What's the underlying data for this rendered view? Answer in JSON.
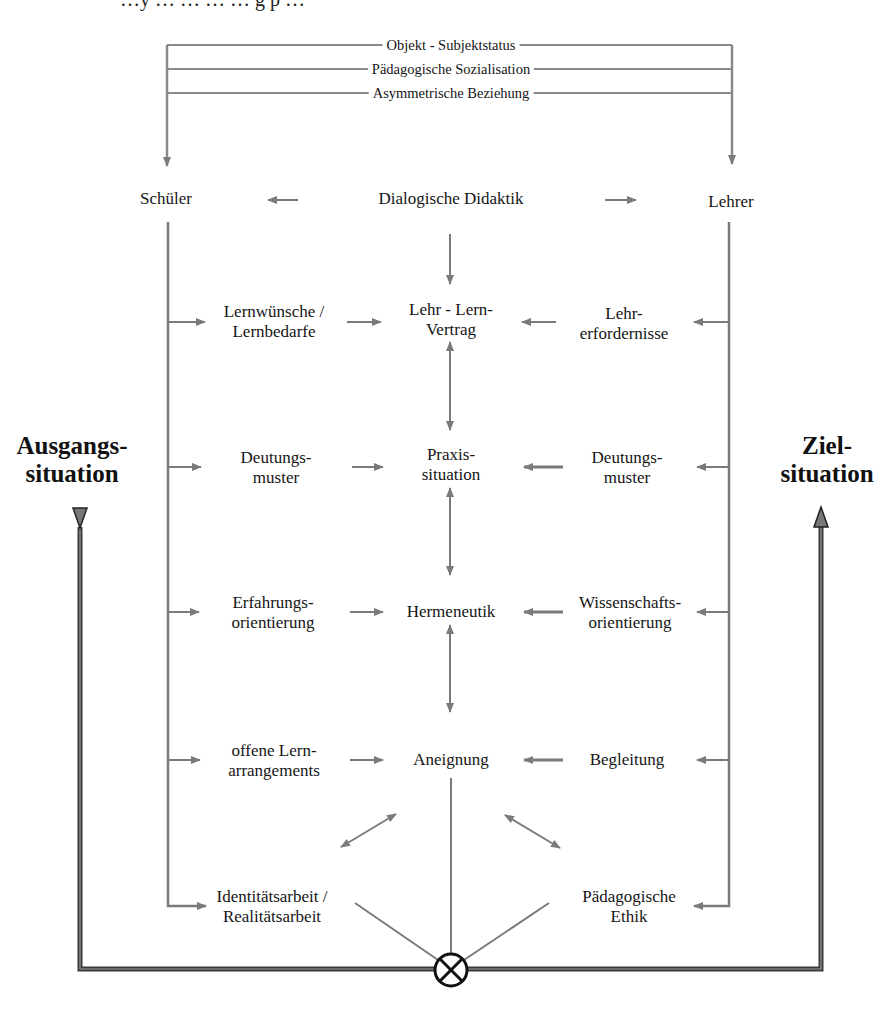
{
  "cutoff_text": "…y … … … … g p …",
  "top_relations": [
    {
      "label": "Objekt - Subjektstatus"
    },
    {
      "label": "Pädagogische Sozialisation"
    },
    {
      "label": "Asymmetrische Beziehung"
    }
  ],
  "actors": {
    "left": "Schüler",
    "center": "Dialogische Didaktik",
    "right": "Lehrer"
  },
  "sides": {
    "left": {
      "line1": "Ausgangs-",
      "line2": "situation"
    },
    "right": {
      "line1": "Ziel-",
      "line2": "situation"
    }
  },
  "rows": [
    {
      "left": {
        "line1": "Lernwünsche /",
        "line2": "Lernbedarfe"
      },
      "center": {
        "line1": "Lehr - Lern-",
        "line2": "Vertrag"
      },
      "right": {
        "line1": "Lehr-",
        "line2": "erfordernisse"
      }
    },
    {
      "left": {
        "line1": "Deutungs-",
        "line2": "muster"
      },
      "center": {
        "line1": "Praxis-",
        "line2": "situation"
      },
      "right": {
        "line1": "Deutungs-",
        "line2": "muster"
      }
    },
    {
      "left": {
        "line1": "Erfahrungs-",
        "line2": "orientierung"
      },
      "center": {
        "line1": "Hermeneutik",
        "line2": ""
      },
      "right": {
        "line1": "Wissenschafts-",
        "line2": "orientierung"
      }
    },
    {
      "left": {
        "line1": "offene Lern-",
        "line2": "arrangements"
      },
      "center": {
        "line1": "Aneignung",
        "line2": ""
      },
      "right": {
        "line1": "Begleitung",
        "line2": ""
      }
    }
  ],
  "bottom": {
    "left": {
      "line1": "Identitätsarbeit /",
      "line2": "Realitätsarbeit"
    },
    "right": {
      "line1": "Pädagogische",
      "line2": "Ethik"
    }
  },
  "junction_symbol": "circle-cross",
  "colors": {
    "line": "#7a7a7a",
    "frame": "#3a3a3a",
    "text": "#151515"
  }
}
